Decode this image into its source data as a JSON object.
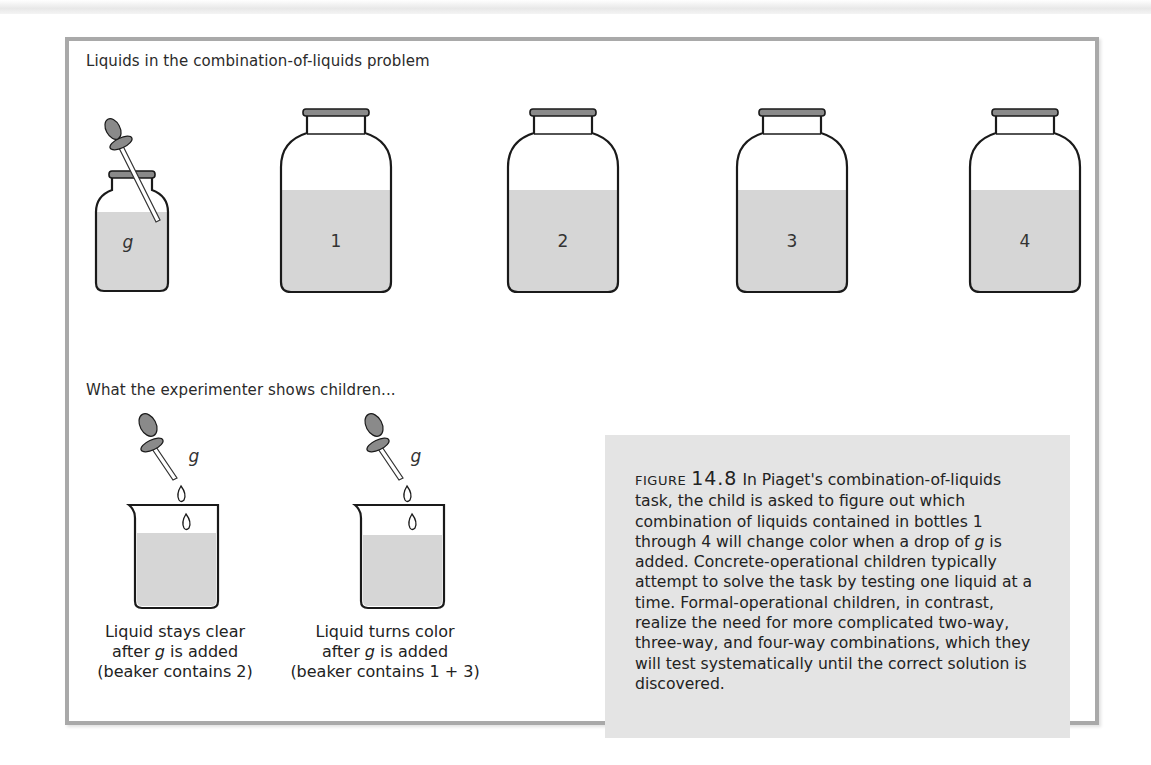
{
  "figure": {
    "section1_heading": "Liquids in the combination-of-liquids problem",
    "section2_heading": "What the experimenter shows children...",
    "bottles": [
      {
        "label": "g",
        "italic": true,
        "has_dropper": true
      },
      {
        "label": "1"
      },
      {
        "label": "2"
      },
      {
        "label": "3"
      },
      {
        "label": "4"
      }
    ],
    "beakers": [
      {
        "dropper_label": "g",
        "caption_line1": "Liquid stays clear",
        "caption_line2_pre": "after ",
        "caption_line2_var": "g",
        "caption_line2_post": " is added",
        "caption_line3": "(beaker contains 2)"
      },
      {
        "dropper_label": "g",
        "caption_line1": "Liquid turns color",
        "caption_line2_pre": "after ",
        "caption_line2_var": "g",
        "caption_line2_post": " is added",
        "caption_line3": "(beaker contains 1 + 3)"
      }
    ],
    "caption": {
      "label": "FIGURE",
      "number": "14.8",
      "text_part1": "In Piaget's combination-of-liquids task, the child is asked to figure out which combination of liquids contained in bottles 1 through 4 will change color when a drop of ",
      "text_var": "g",
      "text_part2": " is added. Concrete-operational children typically attempt to solve the task by testing one liquid at a time. Formal-operational children, in contrast, realize the need for more complicated two-way, three-way, and four-way combinations, which they will test systematically until the correct solution is discovered."
    },
    "colors": {
      "liquid": "#d6d6d6",
      "stopper": "#8a8a8a",
      "frame": "#a9a9a9",
      "caption_bg": "#e4e4e4"
    }
  }
}
